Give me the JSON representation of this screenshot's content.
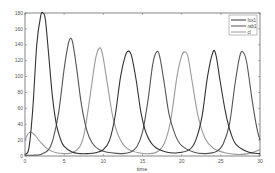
{
  "chart_data": {
    "type": "line",
    "title": "",
    "xlabel": "time",
    "ylabel": "",
    "xlim": [
      0,
      30
    ],
    "ylim": [
      0,
      180
    ],
    "xticks": [
      0,
      5,
      10,
      15,
      20,
      25,
      30
    ],
    "yticks": [
      0,
      20,
      40,
      60,
      80,
      100,
      120,
      140,
      160,
      180
    ],
    "grid": false,
    "legend_position": "upper right",
    "series": [
      {
        "name": "fox1",
        "color": "#333333",
        "x": [
          0,
          0.5,
          1.0,
          1.5,
          2.0,
          2.3,
          2.6,
          3.0,
          3.5,
          4.0,
          4.5,
          5.0,
          6.0,
          7.0,
          8.0,
          9.0,
          10.0,
          10.8,
          11.5,
          12.2,
          12.8,
          13.2,
          13.6,
          14.2,
          14.8,
          15.5,
          16.5,
          18.0,
          19.5,
          21.0,
          21.8,
          22.6,
          23.3,
          24.0,
          24.4,
          24.9,
          25.6,
          26.3,
          27.0,
          28.5,
          30.0
        ],
        "values": [
          2,
          10,
          60,
          140,
          176,
          180,
          172,
          130,
          75,
          40,
          22,
          12,
          5,
          3,
          3,
          4,
          8,
          20,
          50,
          100,
          126,
          132,
          126,
          95,
          55,
          28,
          12,
          5,
          4,
          8,
          20,
          50,
          100,
          131,
          126,
          95,
          55,
          28,
          14,
          5,
          3
        ]
      },
      {
        "name": "rab1",
        "color": "#555555",
        "x": [
          0,
          1.0,
          2.0,
          3.0,
          3.6,
          4.3,
          5.0,
          5.5,
          5.8,
          6.1,
          6.6,
          7.2,
          7.9,
          8.6,
          9.5,
          11.0,
          12.5,
          13.5,
          14.3,
          15.0,
          15.7,
          16.3,
          16.8,
          17.2,
          17.8,
          18.4,
          19.2,
          20.0,
          21.5,
          23.0,
          24.5,
          25.3,
          26.1,
          26.8,
          27.4,
          27.8,
          28.3,
          29.0,
          29.6,
          30.0
        ],
        "values": [
          1,
          1,
          2,
          8,
          22,
          55,
          110,
          140,
          148,
          142,
          110,
          65,
          32,
          16,
          8,
          4,
          3,
          5,
          12,
          30,
          70,
          115,
          131,
          125,
          90,
          52,
          26,
          13,
          5,
          3,
          6,
          15,
          40,
          90,
          125,
          131,
          118,
          70,
          35,
          20
        ]
      },
      {
        "name": "cl",
        "color": "#9a9a9a",
        "x": [
          0,
          0.4,
          0.8,
          1.3,
          2.0,
          3.0,
          4.0,
          5.0,
          6.0,
          7.0,
          7.6,
          8.3,
          9.0,
          9.5,
          9.9,
          10.5,
          11.2,
          12.0,
          13.0,
          14.5,
          16.0,
          17.0,
          17.8,
          18.6,
          19.4,
          20.0,
          20.4,
          20.8,
          21.4,
          22.1,
          23.0,
          24.0,
          25.5,
          27.0,
          28.5,
          30.0
        ],
        "values": [
          20,
          28,
          30,
          26,
          17,
          8,
          4,
          3,
          4,
          12,
          30,
          75,
          122,
          136,
          128,
          92,
          50,
          24,
          10,
          4,
          3,
          6,
          16,
          45,
          100,
          126,
          131,
          125,
          90,
          50,
          22,
          10,
          4,
          2,
          3,
          8
        ]
      }
    ]
  },
  "legend": {
    "items": [
      {
        "label": "fox1",
        "color": "#333333"
      },
      {
        "label": "rab1",
        "color": "#555555"
      },
      {
        "label": "cl",
        "color": "#9a9a9a"
      }
    ]
  },
  "axes": {
    "xlabel": "time",
    "xtick_labels": [
      "0",
      "5",
      "10",
      "15",
      "20",
      "25",
      "30"
    ],
    "ytick_labels": [
      "0",
      "20",
      "40",
      "60",
      "80",
      "100",
      "120",
      "140",
      "160",
      "180"
    ]
  }
}
